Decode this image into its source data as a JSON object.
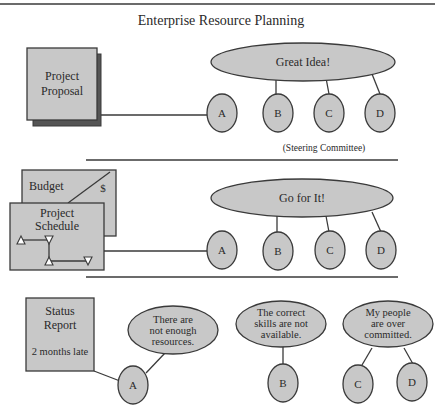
{
  "title": "Enterprise Resource Planning",
  "colors": {
    "shape_fill": "#c8c8c8",
    "shadow_fill": "#555555",
    "stroke": "#3a3a3a",
    "text": "#2a2a2a",
    "background": "#ffffff"
  },
  "stage1": {
    "document": {
      "lines": [
        "Project",
        "Proposal"
      ]
    },
    "ellipse_label": "Great Idea!",
    "nodes": [
      "A",
      "B",
      "C",
      "D"
    ],
    "caption": "(Steering Committee)"
  },
  "stage2": {
    "budget": {
      "label": "Budget",
      "symbol": "$"
    },
    "schedule": {
      "lines": [
        "Project",
        "Schedule"
      ]
    },
    "ellipse_label": "Go for It!",
    "nodes": [
      "A",
      "B",
      "C",
      "D"
    ]
  },
  "stage3": {
    "status_report": {
      "lines": [
        "Status",
        "Report"
      ],
      "note": "2 months late"
    },
    "bubbles": [
      {
        "lines": [
          "There are",
          "not enough",
          "resources."
        ],
        "nodes": [
          "A"
        ]
      },
      {
        "lines": [
          "The correct",
          "skills are not",
          "available."
        ],
        "nodes": [
          "B"
        ]
      },
      {
        "lines": [
          "My people",
          "are over",
          "committed."
        ],
        "nodes": [
          "C",
          "D"
        ]
      }
    ]
  }
}
